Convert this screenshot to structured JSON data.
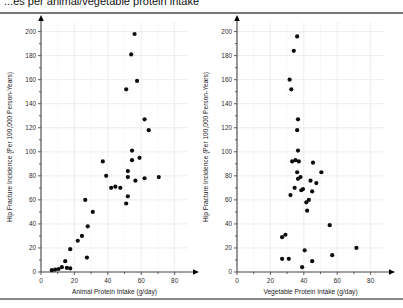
{
  "title": "...es per animal/vegetable protein intake",
  "chart_data": [
    {
      "type": "scatter",
      "id": "animal-protein",
      "title": "",
      "xlabel": "Animal Protein Intake (g/day)",
      "ylabel": "Hip Fracture Incidence (Per 100,000 Person-Years)",
      "xlim": [
        0,
        88
      ],
      "ylim": [
        0,
        208
      ],
      "xticks": [
        0,
        20,
        40,
        60,
        80
      ],
      "yticks": [
        0,
        20,
        40,
        60,
        80,
        100,
        120,
        140,
        160,
        180,
        200
      ],
      "xtick_labels": [
        "0",
        "20",
        "40",
        "60",
        "80"
      ],
      "ytick_labels": [
        "0",
        "20",
        "40",
        "60",
        "80",
        "100",
        "120",
        "140",
        "160",
        "180",
        "200"
      ],
      "grid": true,
      "legend": "none",
      "points": [
        {
          "x": 56.0,
          "y": 198.0
        },
        {
          "x": 54.0,
          "y": 181.0
        },
        {
          "x": 57.5,
          "y": 159.0
        },
        {
          "x": 51.0,
          "y": 152.0
        },
        {
          "x": 62.0,
          "y": 127.0
        },
        {
          "x": 64.5,
          "y": 118.0
        },
        {
          "x": 54.5,
          "y": 101.0
        },
        {
          "x": 59.0,
          "y": 95.0
        },
        {
          "x": 37.0,
          "y": 92.0
        },
        {
          "x": 52.0,
          "y": 84.0
        },
        {
          "x": 52.0,
          "y": 79.0
        },
        {
          "x": 56.5,
          "y": 76.0
        },
        {
          "x": 54.5,
          "y": 93.0
        },
        {
          "x": 70.5,
          "y": 79.0
        },
        {
          "x": 62.0,
          "y": 78.0
        },
        {
          "x": 39.0,
          "y": 80.0
        },
        {
          "x": 44.5,
          "y": 71.0
        },
        {
          "x": 42.0,
          "y": 70.0
        },
        {
          "x": 47.5,
          "y": 70.0
        },
        {
          "x": 52.0,
          "y": 63.0
        },
        {
          "x": 51.0,
          "y": 57.0
        },
        {
          "x": 26.5,
          "y": 60.0
        },
        {
          "x": 31.0,
          "y": 50.0
        },
        {
          "x": 28.0,
          "y": 38.0
        },
        {
          "x": 24.5,
          "y": 30.0
        },
        {
          "x": 22.0,
          "y": 26.0
        },
        {
          "x": 17.5,
          "y": 19.0
        },
        {
          "x": 27.5,
          "y": 12.0
        },
        {
          "x": 14.5,
          "y": 9.0
        },
        {
          "x": 12.5,
          "y": 4.0
        },
        {
          "x": 15.5,
          "y": 3.5
        },
        {
          "x": 17.5,
          "y": 3.0
        },
        {
          "x": 10.5,
          "y": 2.5
        },
        {
          "x": 8.5,
          "y": 2.0
        },
        {
          "x": 6.5,
          "y": 1.5
        }
      ]
    },
    {
      "type": "scatter",
      "id": "vegetable-protein",
      "title": "",
      "xlabel": "Vegetable Protein Intake (g/day)",
      "ylabel": "Hip Fracture Incidence (Per 100,000 Person-Years)",
      "xlim": [
        0,
        88
      ],
      "ylim": [
        0,
        208
      ],
      "xticks": [
        0,
        20,
        40,
        60,
        80
      ],
      "yticks": [
        0,
        20,
        40,
        60,
        80,
        100,
        120,
        140,
        160,
        180,
        200
      ],
      "xtick_labels": [
        "0",
        "20",
        "40",
        "60",
        "80"
      ],
      "ytick_labels": [
        "0",
        "20",
        "40",
        "60",
        "80",
        "100",
        "120",
        "140",
        "160",
        "180",
        "200"
      ],
      "grid": true,
      "legend": "none",
      "points": [
        {
          "x": 36.0,
          "y": 196.0
        },
        {
          "x": 34.0,
          "y": 184.0
        },
        {
          "x": 31.5,
          "y": 160.0
        },
        {
          "x": 32.5,
          "y": 152.0
        },
        {
          "x": 36.5,
          "y": 127.0
        },
        {
          "x": 36.0,
          "y": 118.0
        },
        {
          "x": 36.5,
          "y": 101.0
        },
        {
          "x": 35.0,
          "y": 93.0
        },
        {
          "x": 33.0,
          "y": 92.0
        },
        {
          "x": 37.0,
          "y": 92.0
        },
        {
          "x": 45.5,
          "y": 91.0
        },
        {
          "x": 36.0,
          "y": 83.0
        },
        {
          "x": 50.5,
          "y": 83.0
        },
        {
          "x": 38.0,
          "y": 79.0
        },
        {
          "x": 36.5,
          "y": 77.5
        },
        {
          "x": 44.0,
          "y": 76.0
        },
        {
          "x": 47.5,
          "y": 74.0
        },
        {
          "x": 34.5,
          "y": 70.0
        },
        {
          "x": 39.5,
          "y": 69.0
        },
        {
          "x": 38.5,
          "y": 68.0
        },
        {
          "x": 45.0,
          "y": 67.0
        },
        {
          "x": 32.0,
          "y": 64.0
        },
        {
          "x": 43.0,
          "y": 60.0
        },
        {
          "x": 41.5,
          "y": 58.0
        },
        {
          "x": 42.0,
          "y": 51.0
        },
        {
          "x": 55.5,
          "y": 39.0
        },
        {
          "x": 29.0,
          "y": 31.0
        },
        {
          "x": 27.0,
          "y": 29.0
        },
        {
          "x": 40.5,
          "y": 18.0
        },
        {
          "x": 57.0,
          "y": 14.0
        },
        {
          "x": 27.0,
          "y": 11.0
        },
        {
          "x": 31.0,
          "y": 11.0
        },
        {
          "x": 45.0,
          "y": 9.0
        },
        {
          "x": 39.0,
          "y": 4.0
        },
        {
          "x": 71.5,
          "y": 20.0
        }
      ]
    }
  ]
}
